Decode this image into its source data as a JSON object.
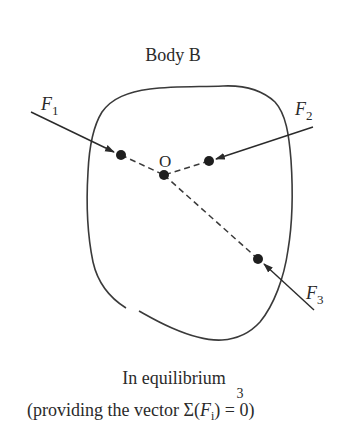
{
  "title": "Body B",
  "point_label": "O",
  "forces": [
    {
      "name": "F",
      "sub": "1"
    },
    {
      "name": "F",
      "sub": "2"
    },
    {
      "name": "F",
      "sub": "3"
    }
  ],
  "caption": {
    "line1": "In equilibrium",
    "line2_prefix": "(providing the vector ",
    "sum_upper": "3",
    "sum_symbol": "Σ",
    "sum_open": "(",
    "sum_var": "F",
    "sum_sub": "i",
    "sum_close": ") = 0)"
  },
  "colors": {
    "stroke": "#3a3a3a",
    "dot": "#1e1e1e",
    "text": "#2a2a2a"
  }
}
